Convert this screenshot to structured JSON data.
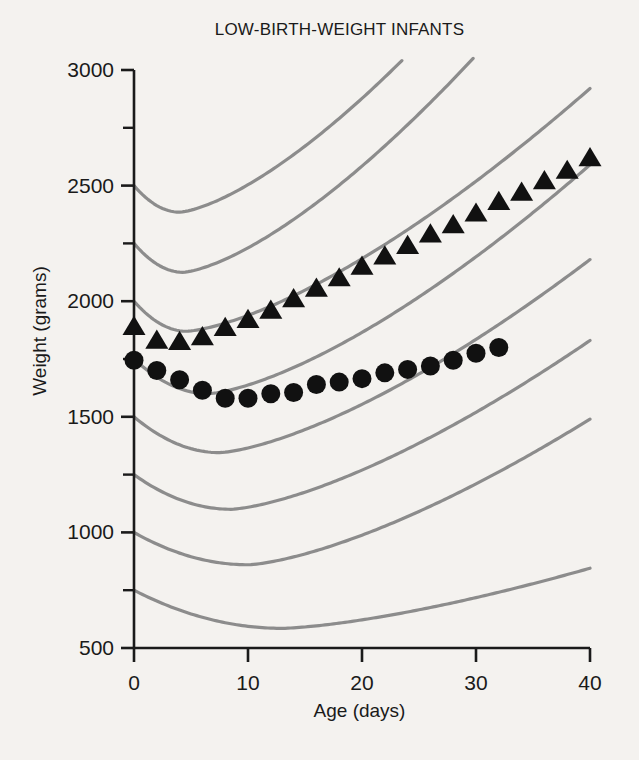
{
  "chart_data": {
    "type": "scatter",
    "title": "LOW-BIRTH-WEIGHT INFANTS",
    "xlabel": "Age (days)",
    "ylabel": "Weight (grams)",
    "xlim": [
      0,
      40
    ],
    "ylim": [
      500,
      3000
    ],
    "grid": false,
    "legend": "none",
    "x_ticks": [
      0,
      10,
      20,
      30,
      40
    ],
    "x_tick_labels": [
      "0",
      "10",
      "20",
      "30",
      "40"
    ],
    "x_minor_ticks": [
      5,
      15,
      25,
      35
    ],
    "y_ticks": [
      500,
      1000,
      1500,
      2000,
      2500,
      3000
    ],
    "y_tick_labels": [
      "500",
      "1000",
      "1500",
      "2000",
      "2500",
      "3000"
    ],
    "y_minor_ticks": [
      750,
      1250,
      1750,
      2250,
      2750
    ],
    "marker_color": "#111111",
    "reference_curve_color": "#8c8c8c",
    "axis_color": "#1a1a1a",
    "background_color": "#f4f2ef",
    "series": [
      {
        "name": "triangles",
        "marker": "triangle",
        "x": [
          0,
          2,
          4,
          6,
          8,
          10,
          12,
          14,
          16,
          18,
          20,
          22,
          24,
          26,
          28,
          30,
          32,
          34,
          36,
          38,
          40
        ],
        "y": [
          1890,
          1830,
          1825,
          1845,
          1885,
          1920,
          1960,
          2010,
          2055,
          2100,
          2150,
          2195,
          2240,
          2290,
          2330,
          2380,
          2430,
          2470,
          2520,
          2565,
          2620
        ]
      },
      {
        "name": "circles",
        "marker": "circle",
        "x": [
          0,
          2,
          4,
          6,
          8,
          10,
          12,
          14,
          16,
          18,
          20,
          22,
          24,
          26,
          28,
          30,
          32
        ],
        "y": [
          1745,
          1700,
          1660,
          1615,
          1580,
          1580,
          1600,
          1605,
          1640,
          1650,
          1665,
          1690,
          1705,
          1720,
          1745,
          1775,
          1800
        ]
      }
    ],
    "reference_curves": [
      {
        "name": "percentile-curve-2500",
        "start_weight": 2500,
        "min_weight": 2385,
        "min_day": 4.0,
        "end_weight": 3090,
        "end_day": 24.5
      },
      {
        "name": "percentile-curve-2250",
        "start_weight": 2250,
        "min_weight": 2125,
        "min_day": 4.3,
        "end_weight": 3090,
        "end_day": 30.5
      },
      {
        "name": "percentile-curve-2000",
        "start_weight": 2000,
        "min_weight": 1870,
        "min_day": 4.6,
        "end_weight": 2920,
        "end_day": 40.0
      },
      {
        "name": "percentile-curve-1750",
        "start_weight": 1750,
        "min_weight": 1600,
        "min_day": 6.5,
        "end_weight": 2590,
        "end_day": 40.0
      },
      {
        "name": "percentile-curve-1500",
        "start_weight": 1500,
        "min_weight": 1345,
        "min_day": 7.5,
        "end_weight": 2180,
        "end_day": 40.0
      },
      {
        "name": "percentile-curve-1250",
        "start_weight": 1250,
        "min_weight": 1100,
        "min_day": 8.5,
        "end_weight": 1830,
        "end_day": 40.0
      },
      {
        "name": "percentile-curve-1000",
        "start_weight": 1000,
        "min_weight": 860,
        "min_day": 10.0,
        "end_weight": 1490,
        "end_day": 40.0
      },
      {
        "name": "percentile-curve-750",
        "start_weight": 750,
        "min_weight": 585,
        "min_day": 13.0,
        "end_weight": 845,
        "end_day": 40.0
      }
    ]
  }
}
